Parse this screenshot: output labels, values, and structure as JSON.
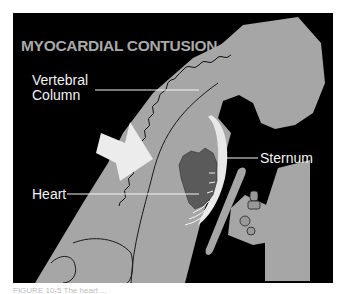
{
  "figure": {
    "title": "MYOCARDIAL CONTUSION",
    "labels": {
      "vertebral_column": "Vertebral\nColumn",
      "vertebral_line1": "Vertebral",
      "vertebral_line2": "Column",
      "heart": "Heart",
      "sternum": "Sternum"
    },
    "caption": "FIGURE 10-5  The heart ...",
    "colors": {
      "background": "#000000",
      "body": "#a6a6a6",
      "heart": "#5a5a5a",
      "arrow": "#ececec",
      "label_text": "#f2f2f2",
      "title_text": "#a9a9a9"
    }
  }
}
